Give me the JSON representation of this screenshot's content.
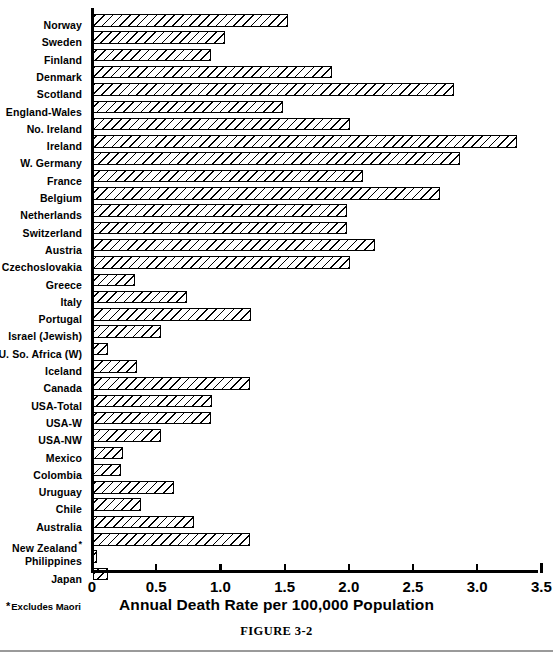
{
  "figure": {
    "caption": "FIGURE 3-2",
    "footnote": "Excludes Maori",
    "footnote_marker": "*"
  },
  "chart_data": {
    "type": "bar",
    "orientation": "horizontal",
    "title": "",
    "xlabel": "Annual Death Rate per 100,000 Population",
    "ylabel": "",
    "xlim": [
      0,
      3.5
    ],
    "xticks": [
      0,
      0.5,
      1.0,
      1.5,
      2.0,
      2.5,
      3.0,
      3.5
    ],
    "xticklabels": [
      "0",
      "0.5",
      "1.0",
      "1.5",
      "2.0",
      "2.5",
      "3.0",
      "3.5"
    ],
    "grid": false,
    "legend": false,
    "bar_style": "diagonal-hatch",
    "categories": [
      "Norway",
      "Sweden",
      "Finland",
      "Denmark",
      "Scotland",
      "England-Wales",
      "No. Ireland",
      "Ireland",
      "W. Germany",
      "France",
      "Belgium",
      "Netherlands",
      "Switzerland",
      "Austria",
      "Czechoslovakia",
      "Greece",
      "Italy",
      "Portugal",
      "Israel (Jewish)",
      "U. So. Africa (W)",
      "Iceland",
      "Canada",
      "USA-Total",
      "USA-W",
      "USA-NW",
      "Mexico",
      "Colombia",
      "Uruguay",
      "Chile",
      "Australia",
      "New Zealand",
      "Philippines",
      "Japan"
    ],
    "category_markers": {
      "New Zealand": "*"
    },
    "values": [
      1.52,
      1.03,
      0.92,
      1.86,
      2.81,
      1.48,
      2.0,
      3.3,
      2.86,
      2.1,
      2.7,
      1.98,
      1.98,
      2.2,
      2.0,
      0.33,
      0.73,
      1.23,
      0.53,
      0.12,
      0.34,
      1.22,
      0.93,
      0.92,
      0.53,
      0.23,
      0.22,
      0.63,
      0.37,
      0.79,
      1.22,
      0.02,
      0.12
    ]
  }
}
